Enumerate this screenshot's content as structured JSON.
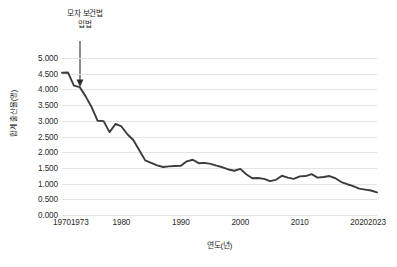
{
  "chart_data": {
    "type": "line",
    "title": "",
    "xlabel": "연도(년)",
    "ylabel": "합계 출산율(명)",
    "xlim": [
      1970,
      2023
    ],
    "ylim": [
      0.0,
      5.0
    ],
    "grid": true,
    "legend": "none",
    "y_ticks": [
      "0.000",
      "0.500",
      "1.000",
      "1.500",
      "2.000",
      "2.500",
      "3.000",
      "3.500",
      "4.000",
      "4.500",
      "5.000"
    ],
    "y_tick_values": [
      0.0,
      0.5,
      1.0,
      1.5,
      2.0,
      2.5,
      3.0,
      3.5,
      4.0,
      4.5,
      5.0
    ],
    "x_ticks": [
      "1970",
      "1973",
      "1980",
      "1990",
      "2000",
      "2010",
      "2020",
      "2023"
    ],
    "x_tick_values": [
      1970,
      1973,
      1980,
      1990,
      2000,
      2010,
      2020,
      2023
    ],
    "line_color": "#3c3c3c",
    "grid_color": "#e4e4e4",
    "background_color": "#ffffff",
    "annotations": [
      {
        "text_line_1": "모자 보건법",
        "text_line_2": "입법",
        "target_x": 1973,
        "target_y": 4.07,
        "arrow": "down-arrow"
      }
    ],
    "x": [
      1970,
      1971,
      1972,
      1973,
      1974,
      1975,
      1976,
      1977,
      1978,
      1979,
      1980,
      1981,
      1982,
      1983,
      1984,
      1985,
      1986,
      1987,
      1988,
      1989,
      1990,
      1991,
      1992,
      1993,
      1994,
      1995,
      1996,
      1997,
      1998,
      1999,
      2000,
      2001,
      2002,
      2003,
      2004,
      2005,
      2006,
      2007,
      2008,
      2009,
      2010,
      2011,
      2012,
      2013,
      2014,
      2015,
      2016,
      2017,
      2018,
      2019,
      2020,
      2021,
      2022,
      2023
    ],
    "values": [
      4.53,
      4.54,
      4.12,
      4.07,
      3.77,
      3.43,
      3.0,
      2.99,
      2.64,
      2.9,
      2.82,
      2.57,
      2.39,
      2.06,
      1.74,
      1.66,
      1.58,
      1.53,
      1.55,
      1.56,
      1.57,
      1.71,
      1.76,
      1.65,
      1.66,
      1.63,
      1.57,
      1.52,
      1.45,
      1.41,
      1.47,
      1.3,
      1.17,
      1.18,
      1.15,
      1.08,
      1.12,
      1.25,
      1.19,
      1.15,
      1.23,
      1.24,
      1.3,
      1.19,
      1.21,
      1.24,
      1.17,
      1.05,
      0.98,
      0.92,
      0.84,
      0.81,
      0.78,
      0.72
    ]
  }
}
